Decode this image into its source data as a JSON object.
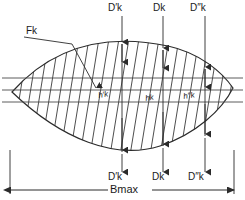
{
  "diagram": {
    "colors": {
      "stroke": "#2b2b2b",
      "hatch": "#3a3a3a",
      "reference_line": "#4a4a4a",
      "background": "#ffffff",
      "text": "#1a1a1a"
    },
    "labels": {
      "area_label": "Fk",
      "top": [
        {
          "id": "top-d-prime",
          "text": "D′k"
        },
        {
          "id": "top-d",
          "text": "Dk"
        },
        {
          "id": "top-d-double-prime",
          "text": "D″k"
        }
      ],
      "bottom": [
        {
          "id": "bottom-d-prime",
          "text": "D′k"
        },
        {
          "id": "bottom-d",
          "text": "Dk"
        },
        {
          "id": "bottom-d-double-prime",
          "text": "D″k"
        }
      ],
      "interior_heights": [
        {
          "id": "h-prime",
          "text": "h′k"
        },
        {
          "id": "h",
          "text": "hk"
        },
        {
          "id": "h-double-prime",
          "text": "h″k"
        }
      ],
      "overall_width": "Bmax"
    },
    "geometry": {
      "lens_left_tip_x": 12,
      "lens_right_tip_x": 233,
      "lens_top_peak_y": 42,
      "lens_bottom_peak_y": 152,
      "reference_lines_y": [
        78,
        90,
        102
      ],
      "dimension_x_positions": [
        122,
        163,
        205
      ],
      "bmax_baseline_y": 190
    }
  }
}
